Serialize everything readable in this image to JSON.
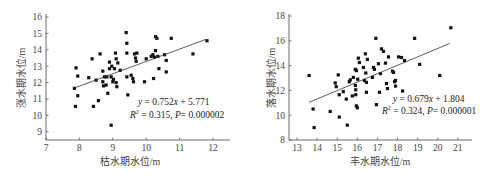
{
  "chart_data": [
    {
      "type": "scatter",
      "title": "",
      "xlabel": "枯水期水位/m",
      "ylabel": "涨水期水位/m",
      "xlim": [
        7,
        12.5
      ],
      "ylim": [
        8.5,
        16
      ],
      "xticks": [
        7,
        8,
        9,
        10,
        11,
        12
      ],
      "yticks": [
        9,
        10,
        11,
        12,
        13,
        14,
        15,
        16
      ],
      "grid": false,
      "regression": {
        "slope": 0.752,
        "intercept": 5.771,
        "x_range": [
          7.85,
          11.8
        ]
      },
      "annotation": {
        "line1": "y = 0.752x + 5.771",
        "line2": "R² = 0.315, P= 0.000002"
      },
      "points": [
        [
          7.85,
          11.65
        ],
        [
          7.88,
          10.55
        ],
        [
          7.9,
          12.9
        ],
        [
          7.95,
          12.4
        ],
        [
          7.95,
          11.2
        ],
        [
          8.28,
          12.3
        ],
        [
          8.38,
          13.45
        ],
        [
          8.42,
          10.55
        ],
        [
          8.5,
          12.15
        ],
        [
          8.57,
          10.9
        ],
        [
          8.62,
          13.75
        ],
        [
          8.7,
          12.7
        ],
        [
          8.7,
          12.05
        ],
        [
          8.72,
          11.8
        ],
        [
          8.75,
          12.35
        ],
        [
          8.8,
          11.85
        ],
        [
          8.82,
          12.35
        ],
        [
          8.85,
          11.35
        ],
        [
          8.9,
          13.25
        ],
        [
          8.9,
          12.85
        ],
        [
          8.95,
          12.35
        ],
        [
          8.95,
          9.4
        ],
        [
          8.97,
          13.0
        ],
        [
          9.0,
          12.05
        ],
        [
          9.02,
          12.2
        ],
        [
          9.05,
          12.85
        ],
        [
          9.08,
          13.8
        ],
        [
          9.1,
          13.45
        ],
        [
          9.1,
          12.0
        ],
        [
          9.12,
          11.75
        ],
        [
          9.15,
          13.2
        ],
        [
          9.22,
          12.75
        ],
        [
          9.4,
          15.05
        ],
        [
          9.42,
          14.4
        ],
        [
          9.42,
          13.8
        ],
        [
          9.42,
          12.35
        ],
        [
          9.45,
          11.25
        ],
        [
          9.55,
          12.45
        ],
        [
          9.6,
          12.25
        ],
        [
          9.62,
          12.05
        ],
        [
          9.65,
          13.75
        ],
        [
          9.68,
          13.5
        ],
        [
          9.7,
          13.3
        ],
        [
          9.72,
          13.8
        ],
        [
          9.95,
          12.05
        ],
        [
          10.0,
          13.45
        ],
        [
          10.15,
          13.6
        ],
        [
          10.2,
          13.7
        ],
        [
          10.22,
          12.25
        ],
        [
          10.25,
          13.55
        ],
        [
          10.28,
          13.95
        ],
        [
          10.28,
          14.8
        ],
        [
          10.32,
          14.7
        ],
        [
          10.35,
          13.6
        ],
        [
          10.38,
          12.85
        ],
        [
          10.55,
          13.7
        ],
        [
          10.6,
          13.35
        ],
        [
          10.6,
          12.65
        ],
        [
          10.75,
          14.7
        ],
        [
          11.4,
          13.75
        ],
        [
          11.82,
          14.55
        ]
      ]
    },
    {
      "type": "scatter",
      "title": "",
      "xlabel": "丰水期水位/m",
      "ylabel": "落水期水位/m",
      "xlim": [
        12.6,
        21.5
      ],
      "ylim": [
        8,
        18
      ],
      "xticks": [
        13,
        14,
        15,
        16,
        17,
        18,
        19,
        20,
        21
      ],
      "yticks": [
        8,
        10,
        12,
        14,
        16,
        18
      ],
      "grid": false,
      "regression": {
        "slope": 0.679,
        "intercept": 1.804,
        "x_range": [
          13.6,
          20.6
        ]
      },
      "annotation": {
        "line1": "y = 0.679x + 1.804",
        "line2": "R² = 0.324, P= 0.000001"
      },
      "points": [
        [
          13.6,
          13.2
        ],
        [
          13.8,
          10.5
        ],
        [
          13.85,
          9.0
        ],
        [
          14.65,
          10.3
        ],
        [
          14.9,
          12.6
        ],
        [
          14.95,
          12.3
        ],
        [
          15.05,
          13.25
        ],
        [
          15.1,
          11.65
        ],
        [
          15.1,
          9.85
        ],
        [
          15.3,
          11.9
        ],
        [
          15.45,
          11.3
        ],
        [
          15.5,
          9.2
        ],
        [
          15.6,
          12.7
        ],
        [
          15.65,
          12.85
        ],
        [
          15.75,
          11.55
        ],
        [
          15.8,
          13.05
        ],
        [
          15.9,
          13.7
        ],
        [
          15.9,
          12.4
        ],
        [
          15.92,
          12.05
        ],
        [
          15.92,
          11.65
        ],
        [
          15.95,
          10.75
        ],
        [
          15.95,
          13.6
        ],
        [
          16.0,
          10.6
        ],
        [
          16.02,
          12.9
        ],
        [
          16.05,
          14.6
        ],
        [
          16.1,
          14.25
        ],
        [
          16.3,
          13.85
        ],
        [
          16.35,
          12.8
        ],
        [
          16.4,
          14.95
        ],
        [
          16.42,
          13.4
        ],
        [
          16.45,
          12.65
        ],
        [
          16.45,
          11.85
        ],
        [
          16.5,
          14.5
        ],
        [
          16.75,
          13.05
        ],
        [
          16.8,
          13.85
        ],
        [
          16.85,
          13.7
        ],
        [
          16.92,
          16.2
        ],
        [
          16.95,
          10.85
        ],
        [
          17.05,
          14.15
        ],
        [
          17.1,
          11.85
        ],
        [
          17.15,
          13.35
        ],
        [
          17.2,
          15.35
        ],
        [
          17.3,
          15.15
        ],
        [
          17.4,
          14.2
        ],
        [
          17.45,
          12.55
        ],
        [
          17.5,
          12.15
        ],
        [
          17.55,
          14.7
        ],
        [
          17.75,
          13.55
        ],
        [
          17.8,
          13.45
        ],
        [
          17.85,
          12.7
        ],
        [
          17.9,
          12.35
        ],
        [
          17.9,
          12.8
        ],
        [
          18.05,
          14.7
        ],
        [
          18.2,
          14.65
        ],
        [
          18.25,
          11.95
        ],
        [
          18.35,
          14.4
        ],
        [
          18.85,
          16.2
        ],
        [
          19.1,
          14.1
        ],
        [
          20.1,
          13.2
        ],
        [
          20.65,
          17.05
        ]
      ]
    }
  ],
  "charts": [
    {
      "xlabel": "枯水期水位/m",
      "ylabel": "涨水期水位/m",
      "eq1_a": "y",
      "eq1_b": " = 0.752",
      "eq1_c": "x",
      "eq1_d": " + 5.771",
      "eq2_a": "R",
      "eq2_sup": "2",
      "eq2_b": " = 0.315, ",
      "eq2_c": "P",
      "eq2_d": "= 0.000002",
      "xticks": [
        "7",
        "8",
        "9",
        "10",
        "11",
        "12"
      ],
      "yticks": [
        "9",
        "10",
        "11",
        "12",
        "13",
        "14",
        "15",
        "16"
      ]
    },
    {
      "xlabel": "丰水期水位/m",
      "ylabel": "落水期水位/m",
      "eq1_a": "y",
      "eq1_b": " = 0.679",
      "eq1_c": "x",
      "eq1_d": " + 1.804",
      "eq2_a": "R",
      "eq2_sup": "2",
      "eq2_b": " = 0.324, ",
      "eq2_c": "P",
      "eq2_d": "= 0.000001",
      "xticks": [
        "13",
        "14",
        "15",
        "16",
        "17",
        "18",
        "19",
        "20",
        "21"
      ],
      "yticks": [
        "8",
        "10",
        "12",
        "14",
        "16",
        "18"
      ]
    }
  ]
}
